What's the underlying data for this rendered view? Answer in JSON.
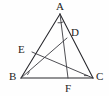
{
  "figure": {
    "canvas": {
      "width": 109,
      "height": 96
    },
    "background_color": "#fefefe",
    "stroke_color": "#26262b",
    "label_color": "#1d1d22"
  },
  "labels": {
    "A": "A",
    "B": "B",
    "C": "C",
    "D": "D",
    "E": "E",
    "F": "F"
  },
  "points": {
    "A": {
      "name": "A",
      "x": 60,
      "y": 14,
      "role": "apex-vertex"
    },
    "B": {
      "name": "B",
      "x": 21,
      "y": 78,
      "role": "base-left-vertex"
    },
    "C": {
      "name": "C",
      "x": 93,
      "y": 78,
      "role": "base-right-vertex"
    },
    "D": {
      "name": "D",
      "x": 67,
      "y": 38,
      "role": "point-on-AC"
    },
    "E": {
      "name": "E",
      "x": 32,
      "y": 52,
      "role": "point-on-AB"
    },
    "F": {
      "name": "F",
      "x": 68,
      "y": 78,
      "role": "point-on-BC"
    }
  },
  "label_positions": {
    "A": {
      "x": 56,
      "y": 1
    },
    "B": {
      "x": 9,
      "y": 72
    },
    "C": {
      "x": 96,
      "y": 72
    },
    "D": {
      "x": 71,
      "y": 27
    },
    "E": {
      "x": 18,
      "y": 44
    },
    "F": {
      "x": 65,
      "y": 84
    }
  },
  "segments": [
    {
      "name": "side-AB",
      "from": "A",
      "to": "B"
    },
    {
      "name": "side-AC",
      "from": "A",
      "to": "C"
    },
    {
      "name": "side-BC",
      "from": "B",
      "to": "C"
    },
    {
      "name": "cevian-AF",
      "from": "A",
      "to": "F"
    },
    {
      "name": "cevian-BD",
      "from": "B",
      "to": "D"
    },
    {
      "name": "cevian-EC",
      "from": "E",
      "to": "C"
    }
  ],
  "angle_marks": [
    {
      "name": "angle-mark-at-A",
      "vertex": "A",
      "style": "arc"
    },
    {
      "name": "angle-mark-at-B",
      "vertex": "B",
      "style": "tick"
    },
    {
      "name": "angle-mark-at-C",
      "vertex": "C",
      "style": "tick"
    }
  ]
}
